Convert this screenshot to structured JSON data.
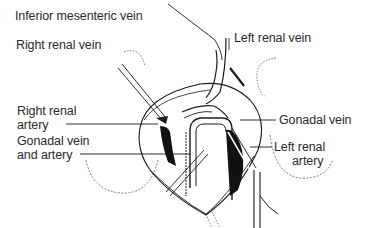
{
  "diagram": {
    "type": "anatomical-illustration",
    "labels": {
      "inferior_mesenteric_vein": "Inferior mesenteric vein",
      "right_renal_vein": "Right renal vein",
      "left_renal_vein": "Left renal vein",
      "right_renal_artery_line1": "Right renal",
      "right_renal_artery_line2": "artery",
      "gonadal_vein_artery_line1": "Gonadal vein",
      "gonadal_vein_artery_line2": "and artery",
      "gonadal_vein": "Gonadal vein",
      "left_renal_artery_line1": "Left renal",
      "left_renal_artery_line2": "artery"
    },
    "colors": {
      "ink": "#1a1a1a",
      "background": "#ffffff",
      "text": "#2a2a2a"
    }
  }
}
